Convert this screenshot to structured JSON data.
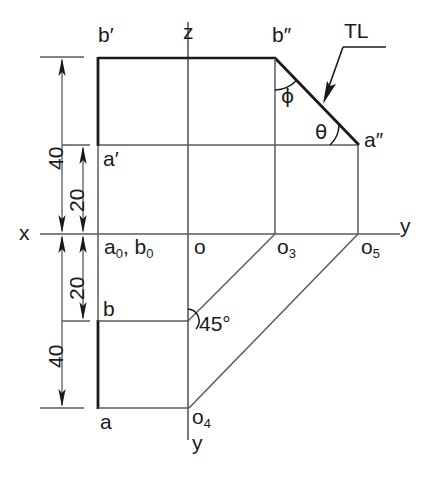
{
  "figure": {
    "type": "orthographic-projection-drawing",
    "title": "",
    "axes": {
      "x_label": "x",
      "z_label": "z",
      "y_label_right": "y",
      "y_label_bottom": "y"
    },
    "dimensions": [
      {
        "name": "upper-overall",
        "value": "40"
      },
      {
        "name": "upper-inner",
        "value": "20"
      },
      {
        "name": "lower-inner",
        "value": "20"
      },
      {
        "name": "lower-overall",
        "value": "40"
      }
    ],
    "point_labels": [
      {
        "id": "b-prime",
        "text": "b′"
      },
      {
        "id": "a-prime",
        "text": "a′"
      },
      {
        "id": "b-double",
        "text": "b″"
      },
      {
        "id": "a-double",
        "text": "a″"
      },
      {
        "id": "a0-b0",
        "text": "a",
        "sub": "0",
        "text2": ", b",
        "sub2": "0"
      },
      {
        "id": "o",
        "text": "o"
      },
      {
        "id": "o3",
        "text": "o",
        "sub": "3"
      },
      {
        "id": "o5",
        "text": "o",
        "sub": "5"
      },
      {
        "id": "o4",
        "text": "o",
        "sub": "4"
      },
      {
        "id": "b",
        "text": "b"
      },
      {
        "id": "a",
        "text": "a"
      }
    ],
    "annotations": {
      "true_length": "TL",
      "angle_phi": "ϕ",
      "angle_theta": "θ",
      "angle_45": "45°"
    },
    "colors": {
      "line": "#1a1a1a",
      "thin_line": "#555555",
      "background": "#ffffff"
    }
  }
}
